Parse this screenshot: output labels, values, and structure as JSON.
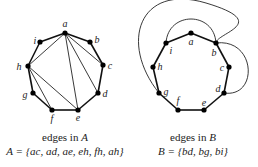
{
  "left_graph": {
    "title": "edges in A",
    "title_prefix": "edges in ",
    "title_set": "A",
    "formula": "A = {ac, ad, ae, eh, fh, ah}",
    "vertices": [
      {
        "id": "a",
        "x": 65,
        "y": 33,
        "lx": 65,
        "ly": 27
      },
      {
        "id": "b",
        "x": 90,
        "y": 42,
        "lx": 97,
        "ly": 43
      },
      {
        "id": "c",
        "x": 103,
        "y": 65,
        "lx": 110,
        "ly": 69
      },
      {
        "id": "d",
        "x": 98,
        "y": 93,
        "lx": 105,
        "ly": 97
      },
      {
        "id": "e",
        "x": 78,
        "y": 110,
        "lx": 78,
        "ly": 121
      },
      {
        "id": "f",
        "x": 52,
        "y": 110,
        "lx": 52,
        "ly": 122
      },
      {
        "id": "g",
        "x": 33,
        "y": 93,
        "lx": 25,
        "ly": 98
      },
      {
        "id": "h",
        "x": 28,
        "y": 66,
        "lx": 19,
        "ly": 70
      },
      {
        "id": "i",
        "x": 40,
        "y": 42,
        "lx": 35,
        "ly": 44
      }
    ],
    "cycle": [
      "a",
      "b",
      "c",
      "d",
      "e",
      "f",
      "g",
      "h",
      "i"
    ],
    "chords": [
      [
        "a",
        "c"
      ],
      [
        "a",
        "d"
      ],
      [
        "a",
        "e"
      ],
      [
        "e",
        "h"
      ],
      [
        "f",
        "h"
      ],
      [
        "a",
        "h"
      ]
    ]
  },
  "right_graph": {
    "title": "edges in B",
    "title_prefix": "edges in ",
    "title_set": "B",
    "formula": "B = {bd, bg, bi}",
    "vertices": [
      {
        "id": "a",
        "x": 191,
        "y": 33,
        "lx": 191,
        "ly": 45
      },
      {
        "id": "b",
        "x": 216,
        "y": 43,
        "lx": 214,
        "ly": 56
      },
      {
        "id": "c",
        "x": 229,
        "y": 67,
        "lx": 222,
        "ly": 71
      },
      {
        "id": "d",
        "x": 224,
        "y": 93,
        "lx": 218,
        "ly": 92
      },
      {
        "id": "e",
        "x": 204,
        "y": 110,
        "lx": 204,
        "ly": 106
      },
      {
        "id": "f",
        "x": 178,
        "y": 110,
        "lx": 178,
        "ly": 104
      },
      {
        "id": "g",
        "x": 159,
        "y": 93,
        "lx": 166,
        "ly": 95
      },
      {
        "id": "h",
        "x": 153,
        "y": 67,
        "lx": 160,
        "ly": 70
      },
      {
        "id": "i",
        "x": 166,
        "y": 43,
        "lx": 171,
        "ly": 54
      }
    ],
    "cycle": [
      "a",
      "b",
      "c",
      "d",
      "e",
      "f",
      "g",
      "h",
      "i"
    ],
    "outer_edges": [
      [
        "b",
        "d"
      ],
      [
        "b",
        "g"
      ],
      [
        "b",
        "i"
      ]
    ]
  }
}
